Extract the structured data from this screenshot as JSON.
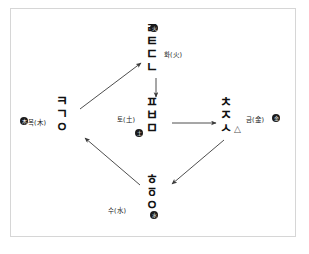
{
  "diagram": {
    "frame": {
      "border_color": "#d6d6d6",
      "background": "#ffffff"
    },
    "stroke_color": "#3a3a3a"
  },
  "nodes": [
    {
      "id": "fire",
      "element_label": "화(火)",
      "position": "top",
      "jamo": [
        "ㄹ",
        "ㅌ",
        "ㄷ",
        "ㄴ"
      ],
      "seal": "火"
    },
    {
      "id": "wood",
      "element_label": "목(木)",
      "position": "left",
      "jamo": [
        "ㅋ",
        "ㄱ",
        "ㅇ"
      ],
      "seal": "木"
    },
    {
      "id": "earth",
      "element_label": "토(土)",
      "position": "center",
      "jamo": [
        "ㅍ",
        "ㅂ",
        "ㅁ"
      ],
      "seal": "土"
    },
    {
      "id": "metal",
      "element_label": "금(金)",
      "position": "right",
      "jamo": [
        "ㅊ",
        "ㅈ",
        "ㅅ"
      ],
      "extra_glyph": "△",
      "seal": "金"
    },
    {
      "id": "water",
      "element_label": "수(水)",
      "position": "bottom",
      "jamo": [
        "ㅎ",
        "ㆆ",
        "ㅇ"
      ],
      "seal": "水"
    }
  ],
  "arrows": [
    {
      "id": "wood-to-fire",
      "from": "wood",
      "to": "fire",
      "name": "arrow-wood-to-fire"
    },
    {
      "id": "fire-to-earth",
      "from": "fire",
      "to": "earth",
      "name": "arrow-fire-to-earth"
    },
    {
      "id": "earth-to-metal",
      "from": "earth",
      "to": "metal",
      "name": "arrow-earth-to-metal"
    },
    {
      "id": "metal-to-water",
      "from": "metal",
      "to": "water",
      "name": "arrow-metal-to-water"
    },
    {
      "id": "water-to-wood",
      "from": "water",
      "to": "wood",
      "name": "arrow-water-to-wood"
    }
  ]
}
